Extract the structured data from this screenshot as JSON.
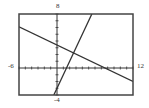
{
  "chart_data": {
    "type": "line",
    "title": "",
    "xlabel": "",
    "ylabel": "",
    "xlim": [
      -6,
      12
    ],
    "ylim": [
      -4,
      8
    ],
    "grid": false,
    "axis_ticks": {
      "x_step": 1,
      "y_step": 1
    },
    "tick_labels": {
      "xmin": "-6",
      "xmax": "12",
      "ymin": "-4",
      "ymax": "8"
    },
    "series": [
      {
        "name": "line-1-increasing",
        "equation": "y = 2x - 3",
        "x": [
          -0.5,
          5.5
        ],
        "y": [
          -4,
          8
        ]
      },
      {
        "name": "line-2-decreasing",
        "equation": "y = -0.45x + 3.4",
        "x": [
          -6,
          12
        ],
        "y": [
          6.1,
          -2.0
        ]
      }
    ],
    "intersection": {
      "x": 2.6,
      "y": 2.2
    }
  },
  "frame": {
    "left": 19,
    "top": 14,
    "right": 133,
    "bottom": 95
  },
  "colors": {
    "frame": "#444444",
    "axis": "#333333",
    "line": "#333333"
  }
}
